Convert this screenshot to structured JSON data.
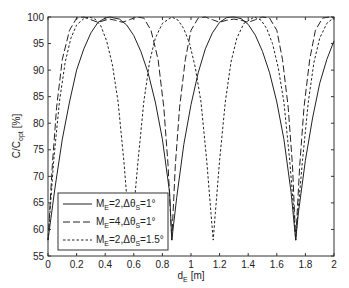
{
  "chart_data": {
    "type": "line",
    "title": "",
    "xlabel": "d_E [m]",
    "xlabel_main": "d",
    "xlabel_sub": "E",
    "xlabel_unit": "[m]",
    "ylabel": "C/C_opt [%]",
    "ylabel_main": "C/C",
    "ylabel_sub": "opt",
    "ylabel_unit": "[%]",
    "xlim": [
      0,
      2
    ],
    "ylim": [
      55,
      100
    ],
    "xticks": [
      "0",
      "0.2",
      "0.4",
      "0.6",
      "0.8",
      "1",
      "1.2",
      "1.4",
      "1.6",
      "1.8",
      "2"
    ],
    "yticks": [
      "55",
      "60",
      "65",
      "70",
      "75",
      "80",
      "85",
      "90",
      "95",
      "100"
    ],
    "grid": false,
    "legend_position": "lower left",
    "series": [
      {
        "name": "M_E=2,Δθ_S=1°",
        "legend_main": "M",
        "legend_sub1": "E",
        "legend_mid": "=2,Δθ",
        "legend_sub2": "S",
        "legend_tail": "=1°",
        "style": "solid",
        "period": 0.866,
        "min_positions": [
          0.0,
          0.866,
          1.732
        ],
        "min_value": 58,
        "x": [
          0,
          0.05,
          0.1,
          0.15,
          0.2,
          0.25,
          0.3,
          0.35,
          0.4,
          0.433,
          0.5,
          0.55,
          0.6,
          0.65,
          0.7,
          0.75,
          0.8,
          0.85,
          0.866,
          0.9,
          0.95,
          1.0,
          1.05,
          1.1,
          1.15,
          1.2,
          1.25,
          1.3,
          1.35,
          1.4,
          1.45,
          1.5,
          1.55,
          1.6,
          1.65,
          1.7,
          1.732,
          1.75,
          1.8,
          1.85,
          1.9,
          1.95,
          2.0
        ],
        "values": [
          58,
          68,
          77,
          84,
          90,
          94,
          97,
          99,
          99.8,
          100,
          99.6,
          98.5,
          96.5,
          93.5,
          89.5,
          84,
          77,
          67,
          58,
          66,
          76,
          83.5,
          89.5,
          94,
          97,
          99,
          99.9,
          100,
          99.7,
          98.6,
          96.6,
          93.5,
          89.5,
          84,
          77,
          67,
          58,
          63,
          73,
          81,
          87.5,
          92,
          95.5
        ]
      },
      {
        "name": "M_E=4,Δθ_S=1°",
        "legend_main": "M",
        "legend_sub1": "E",
        "legend_mid": "=4,Δθ",
        "legend_sub2": "S",
        "legend_tail": "=1°",
        "style": "dashed",
        "period": 0.866,
        "min_positions": [
          0.0,
          0.866,
          1.732
        ],
        "min_value": 58,
        "x": [
          0,
          0.03,
          0.06,
          0.1,
          0.15,
          0.2,
          0.25,
          0.3,
          0.35,
          0.4,
          0.433,
          0.47,
          0.52,
          0.57,
          0.62,
          0.67,
          0.72,
          0.77,
          0.81,
          0.84,
          0.866,
          0.89,
          0.92,
          0.96,
          1.0,
          1.05,
          1.1,
          1.15,
          1.2,
          1.25,
          1.3,
          1.35,
          1.4,
          1.45,
          1.5,
          1.55,
          1.6,
          1.64,
          1.68,
          1.71,
          1.732,
          1.76,
          1.79,
          1.83,
          1.87,
          1.92,
          1.97,
          2.0
        ],
        "values": [
          58,
          72,
          83,
          92,
          97.5,
          99.8,
          100,
          99.5,
          99.0,
          99.4,
          99.6,
          99.4,
          99.0,
          99.5,
          100,
          99.8,
          97.5,
          92,
          83,
          72,
          58,
          72,
          83,
          92,
          97.5,
          99.8,
          100,
          99.5,
          99.0,
          99.4,
          99.6,
          99.4,
          99.0,
          99.5,
          100,
          99.8,
          97.5,
          92,
          83,
          72,
          58,
          72,
          83,
          92,
          97.5,
          99.8,
          100,
          99.8
        ]
      },
      {
        "name": "M_E=2,Δθ_S=1.5°",
        "legend_main": "M",
        "legend_sub1": "E",
        "legend_mid": "=2,Δθ",
        "legend_sub2": "S",
        "legend_tail": "=1.5°",
        "style": "dotted",
        "period": 0.577,
        "min_positions": [
          0.0,
          0.577,
          1.155,
          1.732
        ],
        "min_value": 58,
        "x": [
          0,
          0.04,
          0.08,
          0.12,
          0.16,
          0.2,
          0.25,
          0.289,
          0.33,
          0.37,
          0.41,
          0.45,
          0.49,
          0.53,
          0.56,
          0.577,
          0.6,
          0.63,
          0.67,
          0.71,
          0.75,
          0.8,
          0.866,
          0.91,
          0.95,
          0.99,
          1.03,
          1.07,
          1.11,
          1.14,
          1.155,
          1.17,
          1.2,
          1.24,
          1.28,
          1.32,
          1.37,
          1.443,
          1.49,
          1.53,
          1.57,
          1.61,
          1.65,
          1.69,
          1.72,
          1.732,
          1.75,
          1.78,
          1.82,
          1.86,
          1.9,
          1.95,
          2.0
        ],
        "values": [
          58,
          73,
          84,
          91.5,
          96,
          98.5,
          99.7,
          100,
          99.6,
          98.3,
          95.5,
          91,
          84,
          73,
          63,
          58,
          64,
          73,
          84,
          91.5,
          96,
          98.8,
          100,
          99.4,
          97.8,
          95,
          90.5,
          84,
          73,
          63,
          58,
          63,
          73,
          84,
          91.5,
          96,
          98.8,
          100,
          99.4,
          97.8,
          95,
          90.5,
          84,
          73,
          63,
          58,
          64,
          73,
          84,
          91.5,
          96,
          98.8,
          99.9
        ]
      }
    ]
  }
}
